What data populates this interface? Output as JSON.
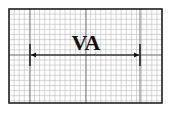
{
  "diagram": {
    "type": "ecg-grid-interval",
    "label": "VA",
    "grid": {
      "x": 9,
      "y": 9,
      "width": 153,
      "height": 94,
      "minor_step": 5.1,
      "major_lines_x": [
        30,
        86,
        140
      ],
      "major_lines_y": [
        55
      ],
      "minor_color": "#b8b8b8",
      "major_color": "#7a7a7a",
      "border_color": "#222222"
    },
    "interval": {
      "x_start": 30,
      "x_end": 140,
      "y": 55,
      "marker_top": 44,
      "marker_bottom": 66,
      "color": "#111111"
    }
  }
}
